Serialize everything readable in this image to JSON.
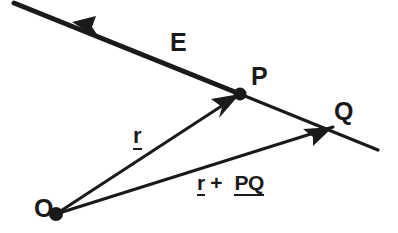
{
  "figure": {
    "background_color": "#ffffff",
    "ink_color": "#1a1a1a",
    "width": 398,
    "height": 233
  },
  "labels": {
    "field_line": "E",
    "point_p": "P",
    "point_q": "Q",
    "point_o": "O",
    "vector_r": "r",
    "sum_r": "r",
    "sum_plus": "+",
    "sum_pq": "PQ"
  },
  "geometry": {
    "field_line": {
      "name": "E",
      "start": [
        14,
        3
      ],
      "end": [
        378,
        150
      ],
      "arrow_at": [
        72,
        22
      ],
      "arrow_direction": "up-left",
      "stroke_width_thick": 5,
      "stroke_width_thin": 3
    },
    "vector_r": {
      "name": "r",
      "from": "O",
      "to": "P",
      "start": [
        56,
        214
      ],
      "end": [
        240,
        94
      ],
      "arrow_direction": "up-right",
      "stroke_width": 3
    },
    "vector_r_plus_pq": {
      "name": "r + PQ",
      "from": "O",
      "to": "Q",
      "start": [
        56,
        214
      ],
      "end": [
        333,
        127
      ],
      "arrow_direction": "up-right",
      "stroke_width": 3
    },
    "points": [
      {
        "name": "O",
        "x": 56,
        "y": 214,
        "radius": 6
      },
      {
        "name": "P",
        "x": 240,
        "y": 94,
        "radius": 6
      },
      {
        "name": "Q",
        "x": 333,
        "y": 127,
        "radius": 0
      }
    ]
  }
}
